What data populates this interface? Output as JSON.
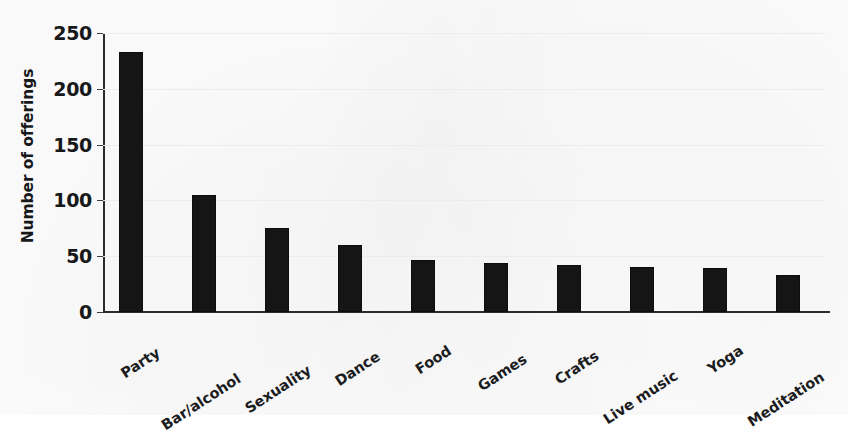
{
  "chart_data": {
    "type": "bar",
    "title": "",
    "subtitle": "",
    "xlabel": "",
    "ylabel": "Number of offerings",
    "ylim": [
      0,
      250
    ],
    "yticks": [
      0,
      50,
      100,
      150,
      200,
      250
    ],
    "ytick_labels": [
      "0",
      "50",
      "100",
      "150",
      "200",
      "250"
    ],
    "grid": true,
    "legend": false,
    "legend_position": "none",
    "categories": [
      "Party",
      "Bar/alcohol",
      "Sexuality",
      "Dance",
      "Food",
      "Games",
      "Crafts",
      "Live music",
      "Yoga",
      "Meditation"
    ],
    "values": [
      233,
      105,
      75,
      60,
      47,
      44,
      42,
      40,
      39,
      33
    ],
    "bar_color": "#151515",
    "grid_color": "#ececef",
    "axis_color": "#2b2b2b",
    "background_color": "#fdfdfd"
  }
}
